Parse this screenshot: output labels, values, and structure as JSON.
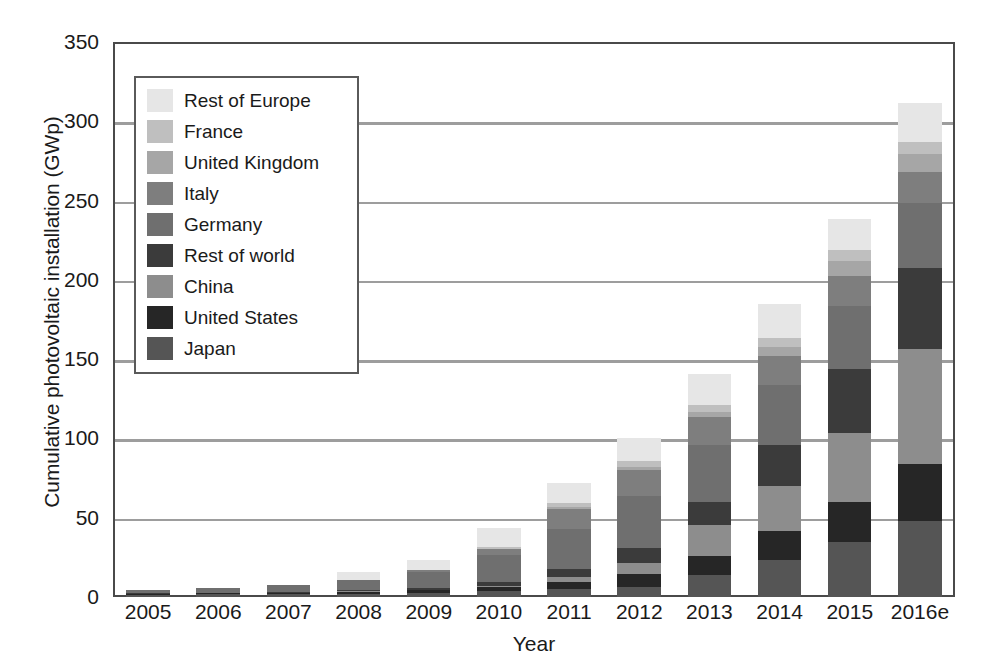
{
  "chart_data": {
    "type": "bar",
    "stacked": true,
    "title": "",
    "xlabel": "Year",
    "ylabel": "Cumulative photovoltaic installation (GWp)",
    "categories": [
      "2005",
      "2006",
      "2007",
      "2008",
      "2009",
      "2010",
      "2011",
      "2012",
      "2013",
      "2014",
      "2015",
      "2016e"
    ],
    "ylim": [
      0,
      350
    ],
    "yticks": [
      0,
      50,
      100,
      150,
      200,
      250,
      300,
      350
    ],
    "ytick_labels": [
      "0",
      "50",
      "100",
      "150",
      "200",
      "250",
      "300",
      "350"
    ],
    "grid": true,
    "legend_position": "upper-left-inside",
    "series": [
      {
        "name": "Japan",
        "color": "#555555",
        "values": [
          1.4,
          1.7,
          1.9,
          2.1,
          2.6,
          3.6,
          4.9,
          6.6,
          13.6,
          23.3,
          34.4,
          48.0
        ]
      },
      {
        "name": "United States",
        "color": "#262626",
        "values": [
          0.5,
          0.6,
          0.8,
          1.2,
          1.6,
          2.5,
          4.4,
          7.8,
          12.1,
          18.3,
          25.6,
          35.8
        ]
      },
      {
        "name": "China",
        "color": "#8d8d8d",
        "values": [
          0.1,
          0.1,
          0.1,
          0.2,
          0.3,
          0.9,
          3.3,
          7.0,
          19.7,
          28.2,
          43.5,
          72.5
        ]
      },
      {
        "name": "Rest of world",
        "color": "#3b3b3b",
        "values": [
          0.3,
          0.4,
          0.6,
          0.9,
          1.4,
          2.4,
          5.2,
          9.8,
          14.4,
          25.8,
          40.6,
          51.2
        ]
      },
      {
        "name": "Germany",
        "color": "#6f6f6f",
        "values": [
          1.9,
          2.7,
          4.1,
          6.1,
          9.8,
          17.3,
          25.0,
          32.4,
          36.0,
          38.2,
          39.7,
          41.3
        ]
      },
      {
        "name": "Italy",
        "color": "#7e7e7e",
        "values": [
          0.0,
          0.1,
          0.1,
          0.4,
          1.2,
          3.5,
          12.8,
          16.4,
          17.9,
          18.5,
          18.9,
          19.3
        ]
      },
      {
        "name": "United Kingdom",
        "color": "#a6a6a6",
        "values": [
          0.0,
          0.0,
          0.0,
          0.0,
          0.0,
          0.1,
          1.0,
          1.8,
          2.9,
          5.5,
          9.1,
          11.6
        ]
      },
      {
        "name": "France",
        "color": "#bfbfbf",
        "values": [
          0.0,
          0.0,
          0.0,
          0.1,
          0.3,
          1.1,
          2.9,
          4.0,
          4.7,
          5.7,
          6.8,
          7.1
        ]
      },
      {
        "name": "Rest of Europe",
        "color": "#e6e6e6",
        "values": [
          0.1,
          0.2,
          0.3,
          4.7,
          6.4,
          12.4,
          12.6,
          14.6,
          19.1,
          21.3,
          19.8,
          25.0
        ]
      }
    ],
    "totals": [
      4.3,
      5.8,
      7.9,
      15.7,
      23.6,
      43.8,
      72.1,
      100.4,
      140.4,
      184.8,
      238.4,
      311.8
    ],
    "stack_order_bottom_to_top": [
      "Japan",
      "United States",
      "China",
      "Rest of world",
      "Germany",
      "Italy",
      "United Kingdom",
      "France",
      "Rest of Europe"
    ]
  },
  "legend": {
    "items": [
      {
        "label": "Rest of Europe",
        "color": "#e6e6e6"
      },
      {
        "label": "France",
        "color": "#bfbfbf"
      },
      {
        "label": "United Kingdom",
        "color": "#a6a6a6"
      },
      {
        "label": "Italy",
        "color": "#7e7e7e"
      },
      {
        "label": "Germany",
        "color": "#6f6f6f"
      },
      {
        "label": "Rest of world",
        "color": "#3b3b3b"
      },
      {
        "label": "China",
        "color": "#8d8d8d"
      },
      {
        "label": "United States",
        "color": "#262626"
      },
      {
        "label": "Japan",
        "color": "#555555"
      }
    ]
  },
  "axis": {
    "y_title": "Cumulative photovoltaic installation (GWp)",
    "x_title": "Year"
  },
  "colors": {
    "axis_line": "#4a4a4a",
    "gridline": "#9d9d9d",
    "text": "#1a1a1a",
    "background": "#ffffff",
    "legend_border": "#5a5a5a"
  }
}
